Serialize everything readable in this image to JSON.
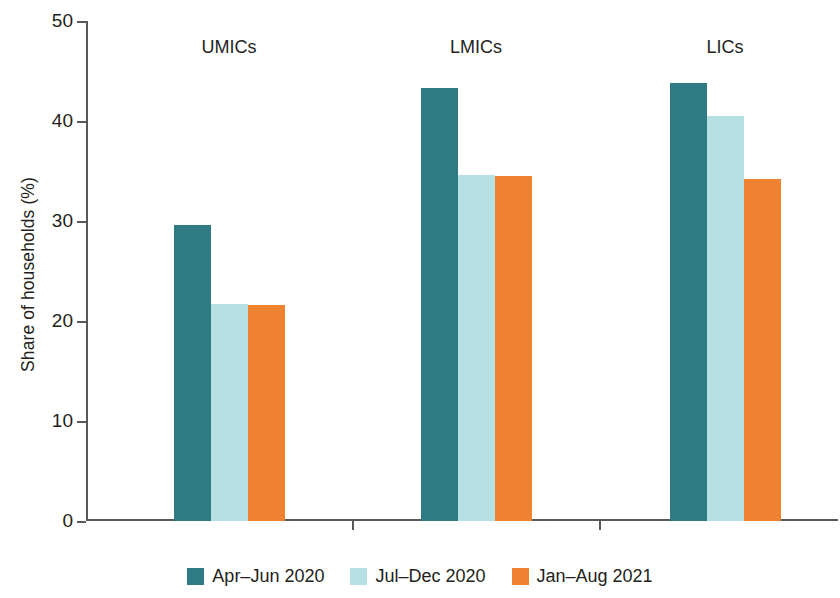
{
  "chart_data": {
    "type": "bar",
    "title": "",
    "xlabel": "",
    "ylabel": "Share of households (%)",
    "ylim": [
      0,
      50
    ],
    "yticks": [
      0,
      10,
      20,
      30,
      40,
      50
    ],
    "grid": false,
    "legend_position": "bottom",
    "categories": [
      "UMICs",
      "LMICs",
      "LICs"
    ],
    "series": [
      {
        "name": "Apr–Jun 2020",
        "color": "#2e7b83",
        "values": [
          29.6,
          43.3,
          43.8
        ]
      },
      {
        "name": "Jul–Dec 2020",
        "color": "#b6e0e4",
        "values": [
          21.7,
          34.6,
          40.5
        ]
      },
      {
        "name": "Jan–Aug 2021",
        "color": "#ef8230",
        "values": [
          21.6,
          34.5,
          34.2
        ]
      }
    ]
  },
  "axis": {
    "y_title": "Share of households (%)",
    "y_tick_labels": [
      "0",
      "10",
      "20",
      "30",
      "40",
      "50"
    ],
    "x_tick_labels": [
      "UMICs",
      "LMICs",
      "LICs"
    ]
  },
  "legend": {
    "items": [
      {
        "label": "Apr–Jun 2020",
        "color": "#2e7b83"
      },
      {
        "label": "Jul–Dec 2020",
        "color": "#b6e0e4"
      },
      {
        "label": "Jan–Aug 2021",
        "color": "#ef8230"
      }
    ]
  },
  "colors": {
    "axis": "#58595b",
    "text": "#231f20",
    "background": "#ffffff"
  }
}
